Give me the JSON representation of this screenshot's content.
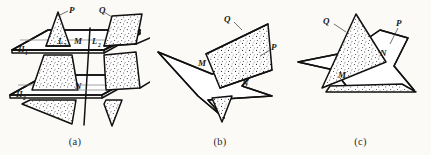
{
  "figure": {
    "background_color": "#fbfaf7",
    "ink_color": "#111111",
    "guide_color": "#7a7a7a"
  },
  "panels": [
    {
      "id": "a",
      "caption": "(a)",
      "labels": {
        "plane_p": "P",
        "plane_q": "Q",
        "line_l1": "L",
        "line_l1_sub": "1",
        "line_m": "M",
        "line_l2": "L",
        "line_l2_sub": "2",
        "line_n": "N",
        "plane_h1": "H",
        "plane_h1_sub": "1",
        "plane_h2": "H",
        "plane_h2_sub": "2"
      }
    },
    {
      "id": "b",
      "caption": "(b)",
      "labels": {
        "plane_q": "Q",
        "plane_p": "P",
        "point_m": "M",
        "point_n": "N"
      }
    },
    {
      "id": "c",
      "caption": "(c)",
      "labels": {
        "plane_q": "Q",
        "plane_p": "P",
        "point_m": "M",
        "point_n": "N"
      }
    }
  ]
}
